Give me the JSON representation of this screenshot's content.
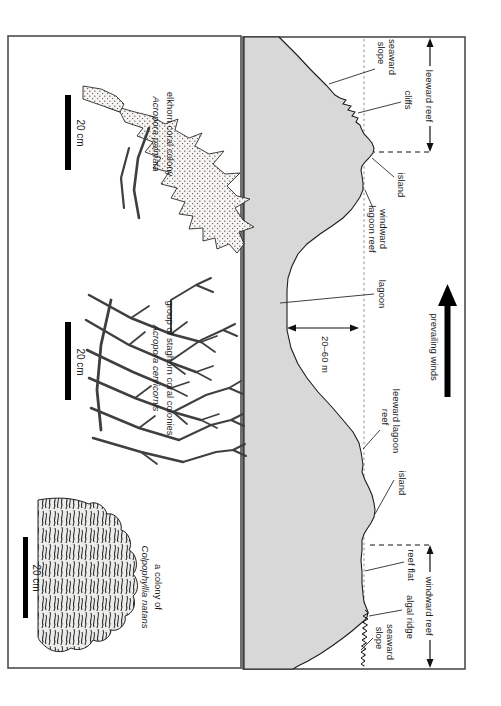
{
  "cross_section": {
    "zone_left_label": "leeward reef",
    "zone_right_label": "windward reef",
    "wind_label": "prevailing winds",
    "lagoon_depth_label": "20–60 m",
    "labels": {
      "seaward_slope_left_1": "seaward",
      "seaward_slope_left_2": "slope",
      "cliffs": "cliffs",
      "island_left": "island",
      "windward_lagoon_reef_1": "windward",
      "windward_lagoon_reef_2": "lagoon reef",
      "lagoon": "lagoon",
      "leeward_lagoon_reef_1": "leeward lagoon",
      "leeward_lagoon_reef_2": "reef",
      "island_right": "island",
      "reef_flat": "reef flat",
      "algal_ridge": "algal ridge",
      "seaward_slope_right_1": "seaward",
      "seaward_slope_right_2": "slope"
    }
  },
  "corals": [
    {
      "name": "elkhorn coral colony",
      "species": "Acropora palmata",
      "scale_label": "20 cm"
    },
    {
      "name": "group of staghorn coral colonies",
      "species": "Acropora cervicornis",
      "scale_label": "20 cm"
    },
    {
      "name": "a colony of",
      "species": "Colpophyllia natans",
      "scale_label": "20 cm"
    }
  ],
  "colors": {
    "land_fill": "#d8d8d8",
    "ink": "#1c1c1c",
    "border": "#4d4d4d"
  }
}
